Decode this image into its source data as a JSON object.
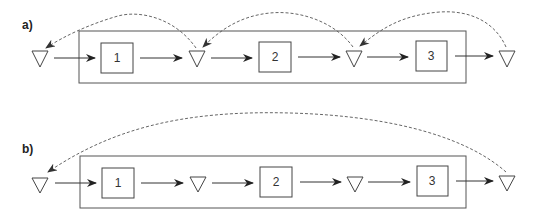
{
  "panels": [
    {
      "label": "a)",
      "description": "Each stage has its own buffer; dashed feedback arcs from each buffer to the previous buffer",
      "boxes": [
        "1",
        "2",
        "3"
      ],
      "buffers_between_stages": true,
      "feedback": "per-stage"
    },
    {
      "label": "b)",
      "description": "Buffers between stages; single dashed feedback arc from the final buffer to the first buffer",
      "boxes": [
        "1",
        "2",
        "3"
      ],
      "buffers_between_stages": true,
      "feedback": "end-to-start"
    }
  ],
  "colors": {
    "line": "#333333",
    "dashed": "#555555",
    "background": "#ffffff"
  }
}
